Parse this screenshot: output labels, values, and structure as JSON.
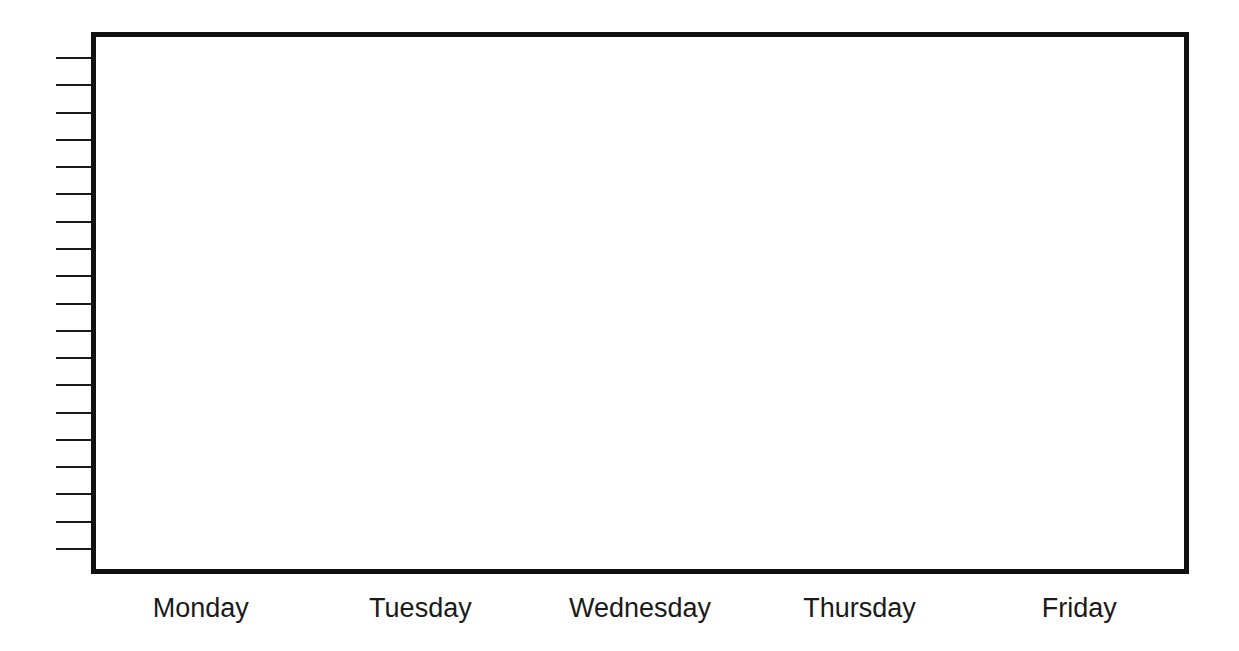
{
  "chart_data": {
    "type": "bar",
    "title": "",
    "xlabel": "",
    "ylabel": "",
    "categories": [
      "Monday",
      "Tuesday",
      "Wednesday",
      "Thursday",
      "Friday"
    ],
    "values": [
      null,
      null,
      null,
      null,
      null
    ],
    "y_tick_count": 19,
    "y_tick_labels": [],
    "grid": false,
    "legend": null,
    "note": "Blank bar graph template: empty plot area, unlabeled y-axis tick marks"
  },
  "style": {
    "frame_color": "#111111",
    "tick_color": "#1a1a1a",
    "label_color": "#1a1a1a",
    "background": "#ffffff"
  }
}
